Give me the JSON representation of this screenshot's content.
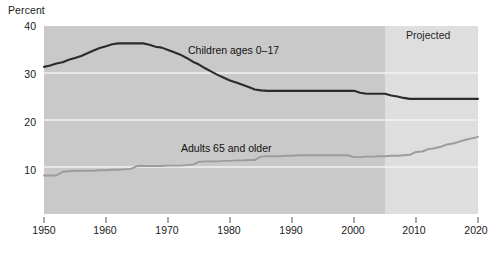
{
  "chart_data": {
    "type": "line",
    "title": "",
    "xlabel": "",
    "ylabel": "Percent",
    "xlim": [
      1950,
      2020
    ],
    "ylim": [
      0,
      40
    ],
    "grid": true,
    "gridlines_y": [
      10,
      20,
      30
    ],
    "legend_position": "inline-annotations",
    "xticks": [
      1950,
      1960,
      1970,
      1980,
      1990,
      2000,
      2010,
      2020
    ],
    "xticklabels": [
      "1950",
      "1960",
      "1970",
      "1980",
      "1990",
      "2000",
      "2010",
      "2020"
    ],
    "yticks": [
      10,
      20,
      30,
      40
    ],
    "yticklabels": [
      "10",
      "20",
      "30",
      "40"
    ],
    "annotations": [
      {
        "text": "Percent",
        "role": "y-axis-title"
      },
      {
        "text": "Children ages 0–17",
        "role": "series-label"
      },
      {
        "text": "Adults 65 and older",
        "role": "series-label"
      },
      {
        "text": "Projected",
        "role": "region-label"
      }
    ],
    "projected_region": {
      "label": "Projected",
      "start": 2005,
      "end": 2020
    },
    "series": [
      {
        "name": "Children ages 0–17",
        "color": "#2b2b2b",
        "x": [
          1950,
          1951,
          1952,
          1953,
          1954,
          1955,
          1956,
          1957,
          1958,
          1959,
          1960,
          1961,
          1962,
          1963,
          1964,
          1965,
          1966,
          1967,
          1968,
          1969,
          1970,
          1971,
          1972,
          1973,
          1974,
          1975,
          1976,
          1977,
          1978,
          1979,
          1980,
          1981,
          1982,
          1983,
          1984,
          1985,
          1986,
          1987,
          1988,
          1989,
          1990,
          1991,
          1992,
          1993,
          1994,
          1995,
          1996,
          1997,
          1998,
          1999,
          2000,
          2001,
          2002,
          2003,
          2004,
          2005,
          2006,
          2007,
          2008,
          2009,
          2010,
          2011,
          2012,
          2013,
          2014,
          2015,
          2016,
          2017,
          2018,
          2019,
          2020
        ],
        "values": [
          31.3,
          31.6,
          32.0,
          32.3,
          32.8,
          33.2,
          33.6,
          34.2,
          34.8,
          35.3,
          35.7,
          36.1,
          36.3,
          36.3,
          36.3,
          36.3,
          36.3,
          36.0,
          35.6,
          35.4,
          34.9,
          34.4,
          33.9,
          33.2,
          32.4,
          31.8,
          31.0,
          30.3,
          29.6,
          29.0,
          28.4,
          28.0,
          27.5,
          27.0,
          26.5,
          26.3,
          26.2,
          26.2,
          26.2,
          26.2,
          26.2,
          26.2,
          26.2,
          26.2,
          26.2,
          26.2,
          26.2,
          26.2,
          26.2,
          26.2,
          26.2,
          25.8,
          25.6,
          25.6,
          25.6,
          25.6,
          25.2,
          25.0,
          24.7,
          24.5,
          24.5,
          24.5,
          24.5,
          24.5,
          24.5,
          24.5,
          24.5,
          24.5,
          24.5,
          24.5,
          24.5
        ]
      },
      {
        "name": "Adults 65 and older",
        "color": "#9c9c9c",
        "x": [
          1950,
          1951,
          1952,
          1953,
          1954,
          1955,
          1956,
          1957,
          1958,
          1959,
          1960,
          1961,
          1962,
          1963,
          1964,
          1965,
          1966,
          1967,
          1968,
          1969,
          1970,
          1971,
          1972,
          1973,
          1974,
          1975,
          1976,
          1977,
          1978,
          1979,
          1980,
          1981,
          1982,
          1983,
          1984,
          1985,
          1986,
          1987,
          1988,
          1989,
          1990,
          1991,
          1992,
          1993,
          1994,
          1995,
          1996,
          1997,
          1998,
          1999,
          2000,
          2001,
          2002,
          2003,
          2004,
          2005,
          2006,
          2007,
          2008,
          2009,
          2010,
          2011,
          2012,
          2013,
          2014,
          2015,
          2016,
          2017,
          2018,
          2019,
          2020
        ],
        "values": [
          8.2,
          8.2,
          8.2,
          9.0,
          9.1,
          9.2,
          9.2,
          9.2,
          9.2,
          9.3,
          9.3,
          9.4,
          9.4,
          9.5,
          9.6,
          10.2,
          10.2,
          10.2,
          10.2,
          10.2,
          10.3,
          10.3,
          10.3,
          10.4,
          10.5,
          11.1,
          11.2,
          11.2,
          11.2,
          11.3,
          11.3,
          11.4,
          11.4,
          11.5,
          11.5,
          12.2,
          12.3,
          12.3,
          12.3,
          12.4,
          12.4,
          12.5,
          12.5,
          12.5,
          12.5,
          12.5,
          12.5,
          12.5,
          12.5,
          12.5,
          12.1,
          12.1,
          12.2,
          12.2,
          12.3,
          12.3,
          12.4,
          12.4,
          12.5,
          12.6,
          13.2,
          13.3,
          13.8,
          14.0,
          14.3,
          14.8,
          15.0,
          15.4,
          15.8,
          16.1,
          16.4
        ]
      }
    ]
  },
  "figure": {
    "bg_plot": "#c9c9c9",
    "bg_projected": "#dedede",
    "gridline_color": "#f2f2f2",
    "text_color": "#1a1a1a"
  }
}
